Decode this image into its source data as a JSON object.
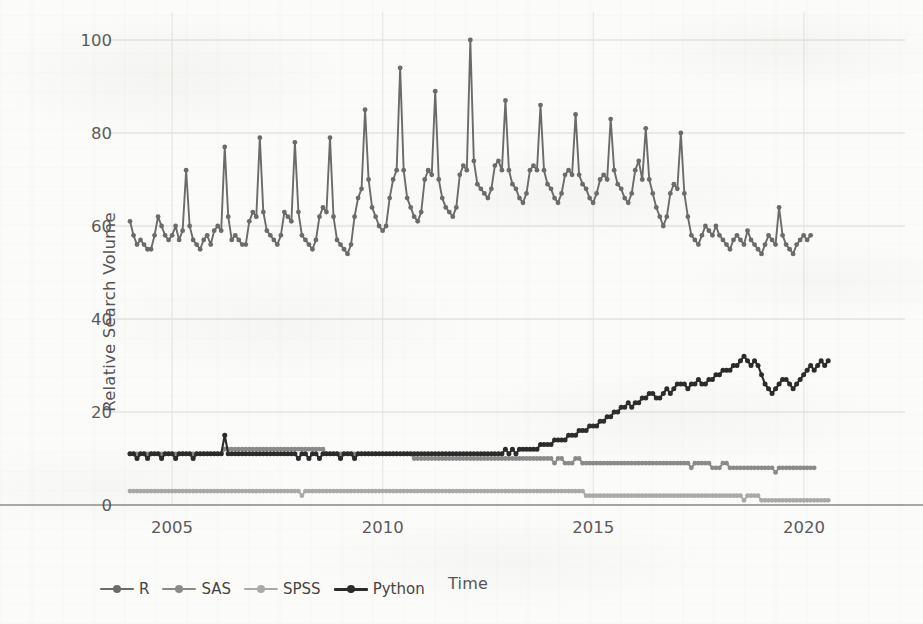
{
  "chart_data": {
    "type": "line",
    "title": "",
    "xlabel": "Time",
    "ylabel": "Relative Search Volume",
    "xlim": [
      2004.0,
      2022.4
    ],
    "ylim": [
      0,
      100
    ],
    "yticks": [
      0,
      20,
      40,
      60,
      80,
      100
    ],
    "xticks": [
      2005,
      2010,
      2015,
      2020
    ],
    "grid": true,
    "legend_position": "bottom",
    "colors": {
      "R": "#6b6b6b",
      "SAS": "#8a8a8a",
      "SPSS": "#a9a9a9",
      "Python": "#2b2b2b"
    },
    "x_start": 2004.0,
    "x_step": 0.0833,
    "series": [
      {
        "name": "R",
        "color": "#6b6b6b",
        "values": [
          61,
          58,
          56,
          57,
          56,
          55,
          55,
          58,
          62,
          60,
          58,
          57,
          58,
          60,
          57,
          59,
          72,
          60,
          57,
          56,
          55,
          57,
          58,
          56,
          59,
          60,
          59,
          77,
          62,
          57,
          58,
          57,
          56,
          56,
          61,
          63,
          62,
          79,
          63,
          59,
          58,
          57,
          56,
          58,
          63,
          62,
          61,
          78,
          63,
          58,
          57,
          56,
          55,
          57,
          62,
          64,
          63,
          79,
          62,
          57,
          56,
          55,
          54,
          56,
          62,
          66,
          68,
          85,
          70,
          64,
          62,
          60,
          59,
          60,
          66,
          70,
          72,
          94,
          72,
          66,
          64,
          62,
          61,
          63,
          70,
          72,
          71,
          89,
          70,
          66,
          64,
          63,
          62,
          64,
          71,
          73,
          72,
          100,
          74,
          69,
          68,
          67,
          66,
          68,
          73,
          74,
          72,
          87,
          72,
          69,
          68,
          66,
          65,
          67,
          72,
          73,
          72,
          86,
          72,
          69,
          68,
          66,
          65,
          67,
          71,
          72,
          71,
          84,
          71,
          69,
          68,
          66,
          65,
          67,
          70,
          71,
          70,
          83,
          72,
          69,
          68,
          66,
          65,
          67,
          72,
          74,
          70,
          81,
          70,
          67,
          64,
          62,
          60,
          62,
          67,
          69,
          68,
          80,
          67,
          62,
          58,
          57,
          56,
          58,
          60,
          59,
          58,
          60,
          58,
          57,
          56,
          55,
          57,
          58,
          57,
          56,
          59,
          57,
          56,
          55,
          54,
          56,
          58,
          57,
          56,
          64,
          58,
          56,
          55,
          54,
          56,
          57,
          58,
          57,
          58
        ]
      },
      {
        "name": "SAS",
        "color": "#8a8a8a",
        "values": [
          11,
          11,
          11,
          11,
          11,
          11,
          11,
          11,
          11,
          11,
          11,
          11,
          11,
          11,
          11,
          11,
          11,
          11,
          11,
          11,
          11,
          11,
          11,
          11,
          11,
          11,
          11,
          12,
          12,
          12,
          12,
          12,
          12,
          12,
          12,
          12,
          12,
          12,
          12,
          12,
          12,
          12,
          12,
          12,
          12,
          12,
          12,
          12,
          12,
          12,
          12,
          12,
          12,
          12,
          12,
          12,
          11,
          11,
          11,
          11,
          11,
          11,
          11,
          11,
          11,
          11,
          11,
          11,
          11,
          11,
          11,
          11,
          11,
          11,
          11,
          11,
          11,
          11,
          11,
          11,
          11,
          10,
          10,
          10,
          10,
          10,
          10,
          10,
          10,
          10,
          10,
          10,
          10,
          10,
          10,
          10,
          10,
          10,
          10,
          10,
          10,
          10,
          10,
          10,
          10,
          10,
          10,
          10,
          10,
          10,
          10,
          10,
          10,
          10,
          10,
          10,
          10,
          10,
          10,
          10,
          10,
          9,
          10,
          10,
          9,
          9,
          9,
          10,
          10,
          9,
          9,
          9,
          9,
          9,
          9,
          9,
          9,
          9,
          9,
          9,
          9,
          9,
          9,
          9,
          9,
          9,
          9,
          9,
          9,
          9,
          9,
          9,
          9,
          9,
          9,
          9,
          9,
          9,
          9,
          9,
          8,
          9,
          9,
          9,
          9,
          9,
          8,
          8,
          8,
          9,
          9,
          8,
          8,
          8,
          8,
          8,
          8,
          8,
          8,
          8,
          8,
          8,
          8,
          8,
          7,
          8,
          8,
          8,
          8,
          8,
          8,
          8,
          8,
          8,
          8,
          8
        ]
      },
      {
        "name": "SPSS",
        "color": "#a9a9a9",
        "values": [
          3,
          3,
          3,
          3,
          3,
          3,
          3,
          3,
          3,
          3,
          3,
          3,
          3,
          3,
          3,
          3,
          3,
          3,
          3,
          3,
          3,
          3,
          3,
          3,
          3,
          3,
          3,
          3,
          3,
          3,
          3,
          3,
          3,
          3,
          3,
          3,
          3,
          3,
          3,
          3,
          3,
          3,
          3,
          3,
          3,
          3,
          3,
          3,
          3,
          2,
          3,
          3,
          3,
          3,
          3,
          3,
          3,
          3,
          3,
          3,
          3,
          3,
          3,
          3,
          3,
          3,
          3,
          3,
          3,
          3,
          3,
          3,
          3,
          3,
          3,
          3,
          3,
          3,
          3,
          3,
          3,
          3,
          3,
          3,
          3,
          3,
          3,
          3,
          3,
          3,
          3,
          3,
          3,
          3,
          3,
          3,
          3,
          3,
          3,
          3,
          3,
          3,
          3,
          3,
          3,
          3,
          3,
          3,
          3,
          3,
          3,
          3,
          3,
          3,
          3,
          3,
          3,
          3,
          3,
          3,
          3,
          3,
          3,
          3,
          3,
          3,
          3,
          3,
          3,
          3,
          2,
          2,
          2,
          2,
          2,
          2,
          2,
          2,
          2,
          2,
          2,
          2,
          2,
          2,
          2,
          2,
          2,
          2,
          2,
          2,
          2,
          2,
          2,
          2,
          2,
          2,
          2,
          2,
          2,
          2,
          2,
          2,
          2,
          2,
          2,
          2,
          2,
          2,
          2,
          2,
          2,
          2,
          2,
          2,
          2,
          1,
          2,
          2,
          2,
          2,
          1,
          1,
          1,
          1,
          1,
          1,
          1,
          1,
          1,
          1,
          1,
          1,
          1,
          1,
          1,
          1,
          1,
          1,
          1,
          1
        ]
      },
      {
        "name": "Python",
        "color": "#2b2b2b",
        "values": [
          11,
          11,
          10,
          11,
          11,
          10,
          11,
          11,
          11,
          10,
          11,
          11,
          11,
          10,
          11,
          11,
          11,
          11,
          10,
          11,
          11,
          11,
          11,
          11,
          11,
          11,
          11,
          15,
          11,
          11,
          11,
          11,
          11,
          11,
          11,
          11,
          11,
          11,
          11,
          11,
          11,
          11,
          11,
          11,
          11,
          11,
          11,
          11,
          10,
          11,
          11,
          10,
          11,
          11,
          10,
          11,
          11,
          11,
          11,
          11,
          10,
          11,
          11,
          11,
          10,
          11,
          11,
          11,
          11,
          11,
          11,
          11,
          11,
          11,
          11,
          11,
          11,
          11,
          11,
          11,
          11,
          11,
          11,
          11,
          11,
          11,
          11,
          11,
          11,
          11,
          11,
          11,
          11,
          11,
          11,
          11,
          11,
          11,
          11,
          11,
          11,
          11,
          11,
          11,
          11,
          11,
          11,
          12,
          11,
          12,
          11,
          12,
          12,
          12,
          12,
          12,
          12,
          13,
          13,
          13,
          13,
          14,
          14,
          14,
          14,
          15,
          15,
          15,
          16,
          16,
          16,
          17,
          17,
          17,
          18,
          18,
          19,
          19,
          20,
          20,
          21,
          21,
          22,
          21,
          22,
          22,
          23,
          23,
          24,
          24,
          23,
          23,
          24,
          25,
          24,
          25,
          26,
          26,
          26,
          25,
          26,
          26,
          27,
          26,
          26,
          27,
          27,
          28,
          28,
          29,
          29,
          29,
          30,
          30,
          31,
          32,
          31,
          30,
          31,
          30,
          28,
          26,
          25,
          24,
          25,
          26,
          27,
          27,
          26,
          25,
          26,
          27,
          28,
          29,
          30,
          29,
          30,
          31,
          30,
          31
        ]
      }
    ]
  },
  "axes": {
    "ytick_labels": [
      "0",
      "20",
      "40",
      "60",
      "80",
      "100"
    ],
    "xtick_labels": [
      "2005",
      "2010",
      "2015",
      "2020"
    ],
    "ylabel": "Relative Search Volume",
    "xlabel": "Time"
  },
  "legend": {
    "items": [
      {
        "label": "R",
        "color": "#6b6b6b"
      },
      {
        "label": "SAS",
        "color": "#8a8a8a"
      },
      {
        "label": "SPSS",
        "color": "#a9a9a9"
      },
      {
        "label": "Python",
        "color": "#2b2b2b"
      }
    ]
  }
}
